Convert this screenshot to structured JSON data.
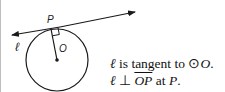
{
  "diagram": {
    "labels": {
      "point_p": "P",
      "center_o": "O",
      "line_l": "ℓ"
    },
    "statement": {
      "line1_prefix": "ℓ",
      "line1_text": " is tangent to ",
      "line1_circle_symbol": "⊙",
      "line1_circle": "O",
      "line1_end": ".",
      "line2_prefix": "ℓ",
      "line2_perp": " ⊥ ",
      "line2_segment": "OP",
      "line2_at": " at ",
      "line2_point": "P",
      "line2_end": "."
    },
    "colors": {
      "stroke": "#1a1a1a",
      "border": "#bdbdbd"
    }
  }
}
